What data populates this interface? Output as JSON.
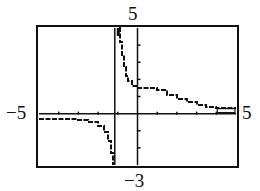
{
  "chart_data": {
    "type": "line",
    "title": "",
    "xlabel": "",
    "ylabel": "",
    "xlim": [
      -5,
      5
    ],
    "ylim": [
      -3,
      5
    ],
    "xtick_step": 1,
    "ytick_step": 1,
    "grid": false,
    "window_labels": {
      "xmin": "−5",
      "xmax": "5",
      "ymin": "−3",
      "ymax": "5"
    },
    "vertical_asymptote": -1,
    "series": [
      {
        "name": "f(x) left branch",
        "x": [
          -5.0,
          -4.2,
          -3.0,
          -2.5,
          -2.0,
          -1.7,
          -1.5,
          -1.35,
          -1.25
        ],
        "y": [
          -0.3,
          -0.3,
          -0.4,
          -0.5,
          -0.75,
          -1.1,
          -1.6,
          -2.3,
          -3.0
        ]
      },
      {
        "name": "f(x) right branch",
        "x": [
          -0.95,
          -0.9,
          -0.8,
          -0.7,
          -0.6,
          -0.5,
          -0.3,
          0.0,
          0.8,
          1.0,
          1.5,
          2.0,
          2.5,
          3.0,
          3.5,
          4.0,
          5.0
        ],
        "y": [
          5.0,
          4.2,
          3.4,
          2.7,
          2.2,
          1.9,
          1.6,
          1.5,
          1.5,
          1.4,
          1.1,
          0.85,
          0.65,
          0.5,
          0.4,
          0.3,
          0.3
        ]
      }
    ]
  }
}
